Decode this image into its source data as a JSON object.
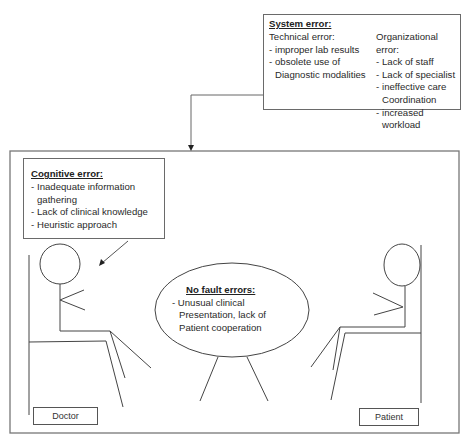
{
  "system_error": {
    "title": "System error:",
    "technical": {
      "title": "Technical error:",
      "items": [
        "improper lab results",
        "obsolete use of Diagnostic modalities"
      ]
    },
    "organizational": {
      "title": "Organizational error:",
      "items": [
        "Lack of staff",
        "Lack of specialist",
        "ineffective care Coordination",
        "increased workload"
      ]
    }
  },
  "cognitive_error": {
    "title": "Cognitive error:",
    "items": [
      "Inadequate information gathering",
      "Lack of clinical knowledge",
      "Heuristic approach"
    ]
  },
  "no_fault_errors": {
    "title": "No fault errors:",
    "lines": [
      "- Unusual clinical",
      "Presentation, lack of",
      "Patient cooperation"
    ]
  },
  "labels": {
    "doctor": "Doctor",
    "patient": "Patient"
  },
  "colors": {
    "line": "#555555",
    "box_border": "#6a6a6a"
  }
}
